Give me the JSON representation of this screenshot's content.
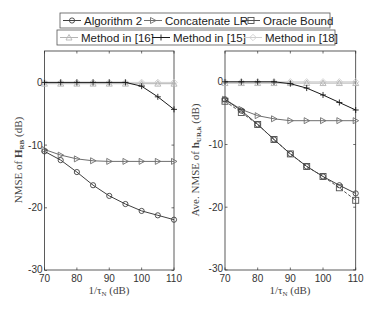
{
  "legend": {
    "row1": [
      {
        "label": "Algorithm 2",
        "marker": "circle",
        "color": "#404040"
      },
      {
        "label": "Concatenate LR",
        "marker": "triangle-right",
        "color": "#6e6e6e"
      },
      {
        "label": "Oracle Bound",
        "marker": "square",
        "color": "#505050"
      }
    ],
    "row2": [
      {
        "label": "Method in [16]",
        "marker": "triangle-up",
        "color": "#b4b4b4"
      },
      {
        "label": "Method in [15]",
        "marker": "plus",
        "color": "#1a1a1a"
      },
      {
        "label": "Method in [18]",
        "marker": "diamond",
        "color": "#cfcfcf"
      }
    ]
  },
  "chart_data": [
    {
      "type": "line",
      "title": "",
      "xlabel": "1/τ_N (dB)",
      "ylabel": "NMSE of H_RB (dB)",
      "xlim": [
        70,
        110
      ],
      "ylim": [
        -30,
        5
      ],
      "xticks": [
        70,
        80,
        90,
        100,
        110
      ],
      "yticks": [
        0,
        -10,
        -20,
        -30
      ],
      "grid": false,
      "x": [
        70,
        75,
        80,
        85,
        90,
        95,
        100,
        105,
        110
      ],
      "series": [
        {
          "name": "Algorithm 2",
          "values": [
            -11.0,
            -12.4,
            -14.3,
            -16.4,
            -18.1,
            -19.4,
            -20.5,
            -21.2,
            -21.9
          ]
        },
        {
          "name": "Concatenate LR",
          "values": [
            -10.7,
            -11.6,
            -12.2,
            -12.5,
            -12.6,
            -12.6,
            -12.6,
            -12.6,
            -12.6
          ]
        },
        {
          "name": "Method in [16]",
          "values": [
            -0.2,
            -0.2,
            -0.2,
            -0.2,
            -0.2,
            -0.2,
            -0.2,
            -0.2,
            -0.2
          ]
        },
        {
          "name": "Method in [15]",
          "values": [
            0,
            0,
            0,
            0,
            0,
            0,
            -0.6,
            -2.3,
            -4.3
          ]
        },
        {
          "name": "Method in [18]",
          "values": [
            0,
            0,
            0,
            0,
            0,
            0,
            0,
            0,
            0
          ]
        }
      ]
    },
    {
      "type": "line",
      "title": "",
      "xlabel": "1/τ_N (dB)",
      "ylabel": "Ave. NMSE of h_UR,k (dB)",
      "xlim": [
        70,
        110
      ],
      "ylim": [
        -30,
        5
      ],
      "xticks": [
        70,
        80,
        90,
        100,
        110
      ],
      "yticks": [
        0,
        -10,
        -20,
        -30
      ],
      "grid": false,
      "x": [
        70,
        75,
        80,
        85,
        90,
        95,
        100,
        105,
        110
      ],
      "series": [
        {
          "name": "Algorithm 2",
          "values": [
            -2.8,
            -4.6,
            -6.8,
            -9.2,
            -11.5,
            -13.5,
            -15.1,
            -16.5,
            -17.8
          ]
        },
        {
          "name": "Concatenate LR",
          "values": [
            -2.8,
            -4.4,
            -5.4,
            -5.9,
            -6.2,
            -6.2,
            -6.2,
            -6.2,
            -6.2
          ]
        },
        {
          "name": "Oracle Bound",
          "values": [
            -3.1,
            -4.9,
            -6.8,
            -9.2,
            -11.5,
            -13.5,
            -15.1,
            -16.9,
            -18.9
          ]
        },
        {
          "name": "Method in [16]",
          "values": [
            -0.2,
            -0.2,
            -0.2,
            -0.2,
            -0.2,
            -0.2,
            -0.2,
            -0.2,
            -0.2
          ]
        },
        {
          "name": "Method in [15]",
          "values": [
            0,
            0,
            0,
            0,
            -0.3,
            -1.0,
            -2.1,
            -3.3,
            -4.5
          ]
        },
        {
          "name": "Method in [18]",
          "values": [
            0,
            0,
            0,
            0,
            0,
            0,
            0,
            0,
            0
          ]
        }
      ]
    }
  ],
  "axes_text": {
    "left_ylabel_main": "NMSE of ",
    "left_ylabel_sym": "H",
    "left_ylabel_sub": "RB",
    "left_ylabel_tail": " (dB)",
    "right_ylabel_main": "Ave. NMSE of ",
    "right_ylabel_sym": "h",
    "right_ylabel_sub": "UR,k",
    "right_ylabel_tail": " (dB)",
    "xlabel_main": "1/τ",
    "xlabel_sub": "N",
    "xlabel_tail": " (dB)"
  }
}
